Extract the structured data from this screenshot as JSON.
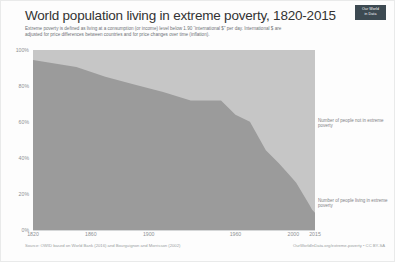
{
  "header": {
    "title": "World population living in extreme poverty, 1820-2015",
    "subtitle": "Extreme poverty is defined as living at a consumption (or income) level below 1.90 “international $” per day. International $ are adjusted for price differences between countries and for price changes over time (inflation).",
    "logo_line1": "Our World",
    "logo_line2": "in Data"
  },
  "footer": {
    "source": "Source: OWID based on World Bank (2016) and Bourguignon and Morrisson (2002)",
    "link": "OurWorldInData.org/extreme-poverty • CC BY-SA"
  },
  "annotations": {
    "top": "Number of people not in extreme poverty",
    "bottom": "Number of people living in extreme poverty"
  },
  "colors": {
    "series_in_poverty": "#9b9b9b",
    "series_not_in_poverty": "#c6c6c6",
    "logo_bg": "#3d4a52",
    "tick_text": "#8d9194",
    "title_text": "#333333"
  },
  "chart_data": {
    "type": "area",
    "stacked": true,
    "title": "World population living in extreme poverty, 1820-2015",
    "xlabel": "",
    "ylabel": "",
    "xlim": [
      1820,
      2015
    ],
    "ylim": [
      0,
      100
    ],
    "grid": false,
    "legend_position": "right-annotations",
    "ytick_labels": [
      "0%",
      "20%",
      "40%",
      "60%",
      "80%",
      "100%"
    ],
    "ytick_values": [
      0,
      20,
      40,
      60,
      80,
      100
    ],
    "xtick_values": [
      1820,
      1860,
      1900,
      1960,
      2000,
      2015
    ],
    "xtick_labels": [
      "1820",
      "1860",
      "1900",
      "1960",
      "2000",
      "2015"
    ],
    "x": [
      1820,
      1850,
      1870,
      1890,
      1910,
      1929,
      1950,
      1960,
      1970,
      1981,
      1990,
      1999,
      2002,
      2008,
      2011,
      2013,
      2015
    ],
    "series": [
      {
        "name": "Number of people living in extreme poverty",
        "color": "#9b9b9b",
        "values": [
          94.4,
          90.5,
          85.1,
          80.8,
          76.6,
          72.0,
          71.9,
          64.0,
          60.1,
          44.3,
          37.1,
          29.0,
          26.3,
          18.2,
          14.1,
          11.2,
          9.6
        ]
      },
      {
        "name": "Number of people not in extreme poverty",
        "color": "#c6c6c6",
        "values": [
          5.6,
          9.5,
          14.9,
          19.2,
          23.4,
          28.0,
          28.1,
          36.0,
          39.9,
          55.7,
          62.9,
          71.0,
          73.7,
          81.8,
          85.9,
          88.8,
          90.4
        ]
      }
    ]
  }
}
